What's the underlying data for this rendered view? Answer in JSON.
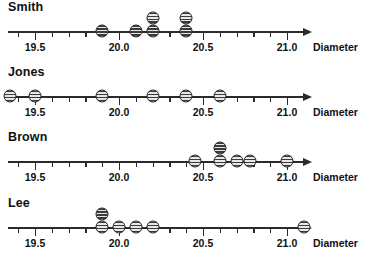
{
  "chart_data": {
    "type": "scatter",
    "title": "",
    "xlabel": "Diameter",
    "ylabel": "",
    "xlim": [
      19.25,
      21.25
    ],
    "grid": false,
    "legend": "none",
    "axis_title": "Diameter",
    "tick_labels": [
      "19.5",
      "20.0",
      "20.5",
      "21.0"
    ],
    "tick_values": [
      19.5,
      20.0,
      20.5,
      21.0
    ],
    "minor_tick_step": 0.1,
    "series": [
      {
        "name": "Smith",
        "values": [
          19.9,
          20.1,
          20.2,
          20.2,
          20.4,
          20.4
        ],
        "stacks": [
          {
            "x": 19.9,
            "count": 1
          },
          {
            "x": 20.1,
            "count": 1
          },
          {
            "x": 20.2,
            "count": 2
          },
          {
            "x": 20.4,
            "count": 2
          }
        ]
      },
      {
        "name": "Jones",
        "values": [
          19.35,
          19.5,
          19.9,
          20.2,
          20.4,
          20.6
        ],
        "stacks": [
          {
            "x": 19.35,
            "count": 1
          },
          {
            "x": 19.5,
            "count": 1
          },
          {
            "x": 19.9,
            "count": 1
          },
          {
            "x": 20.2,
            "count": 1
          },
          {
            "x": 20.4,
            "count": 1
          },
          {
            "x": 20.6,
            "count": 1
          }
        ]
      },
      {
        "name": "Brown",
        "values": [
          20.45,
          20.6,
          20.6,
          20.7,
          20.78,
          21.0
        ],
        "stacks": [
          {
            "x": 20.45,
            "count": 1
          },
          {
            "x": 20.6,
            "count": 2
          },
          {
            "x": 20.7,
            "count": 1
          },
          {
            "x": 20.78,
            "count": 1
          },
          {
            "x": 21.0,
            "count": 1
          }
        ]
      },
      {
        "name": "Lee",
        "values": [
          19.9,
          19.9,
          20.0,
          20.1,
          20.2,
          21.1
        ],
        "stacks": [
          {
            "x": 19.9,
            "count": 2
          },
          {
            "x": 20.0,
            "count": 1
          },
          {
            "x": 20.1,
            "count": 1
          },
          {
            "x": 20.2,
            "count": 1
          },
          {
            "x": 21.1,
            "count": 1
          }
        ]
      }
    ],
    "colors": {
      "axis": "#2b2b2b",
      "text": "#111111",
      "dot_stripe_dark": "#3a3a3a",
      "dot_stripe_light": "#e8e8e8",
      "background": "#ffffff"
    }
  },
  "panels": [
    {
      "label": "Smith"
    },
    {
      "label": "Jones"
    },
    {
      "label": "Brown"
    },
    {
      "label": "Lee"
    }
  ]
}
